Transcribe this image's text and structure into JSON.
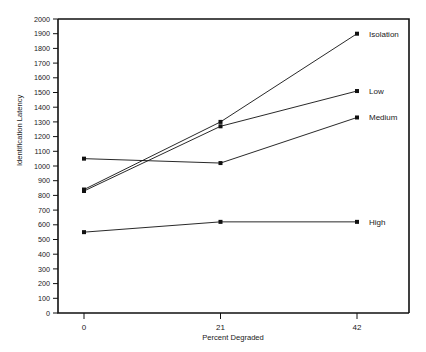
{
  "chart_data": {
    "type": "line",
    "title": "",
    "xlabel": "Percent Degraded",
    "ylabel": "Identification Latency",
    "x": [
      0,
      21,
      42
    ],
    "xlim": [
      -4,
      50
    ],
    "ylim": [
      0,
      2000
    ],
    "xtick_labels": [
      "0",
      "21",
      "42"
    ],
    "ytick_labels": [
      "0",
      "100",
      "200",
      "300",
      "400",
      "500",
      "600",
      "700",
      "800",
      "900",
      "1000",
      "1100",
      "1200",
      "1300",
      "1400",
      "1500",
      "1600",
      "1700",
      "1800",
      "1900",
      "2000"
    ],
    "ytick_values": [
      0,
      100,
      200,
      300,
      400,
      500,
      600,
      700,
      800,
      900,
      1000,
      1100,
      1200,
      1300,
      1400,
      1500,
      1600,
      1700,
      1800,
      1900,
      2000
    ],
    "grid": false,
    "legend_position": "right-inline-end-of-line",
    "series": [
      {
        "name": "Isolation",
        "values": [
          840,
          1300,
          1900
        ]
      },
      {
        "name": "Low",
        "values": [
          830,
          1270,
          1510
        ]
      },
      {
        "name": "Medium",
        "values": [
          1050,
          1020,
          1330
        ]
      },
      {
        "name": "High",
        "values": [
          550,
          620,
          620
        ]
      }
    ]
  },
  "axes": {
    "y_title": "Identification Latency",
    "x_title": "Percent Degraded"
  }
}
